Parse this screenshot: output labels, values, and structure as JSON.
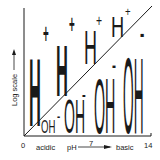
{
  "diagram": {
    "y_axis_label": "Log scale",
    "x_axis": {
      "label": "pH",
      "min_label": "0",
      "mid_label": "7",
      "max_label": "14",
      "left_label": "acidic",
      "right_label": "basic"
    },
    "upper_region_ion": "H+",
    "lower_region_ion": "OH-",
    "h_ions": [
      {
        "text": "H",
        "sup": "+",
        "size": "largest"
      },
      {
        "text": "H",
        "sup": "+",
        "size": "large"
      },
      {
        "text": "H",
        "sup": "+",
        "size": "medium"
      },
      {
        "text": "H",
        "sup": "+",
        "size": "small"
      }
    ],
    "oh_ions": [
      {
        "text": "OH",
        "sup": "-",
        "size": "small"
      },
      {
        "text": "OH",
        "sup": "-",
        "size": "medium"
      },
      {
        "text": "OH",
        "sup": "-",
        "size": "large"
      },
      {
        "text": "OH",
        "sup": "-",
        "size": "largest"
      }
    ],
    "colors": {
      "ink": "#1a1a1a",
      "background": "#ffffff"
    }
  }
}
